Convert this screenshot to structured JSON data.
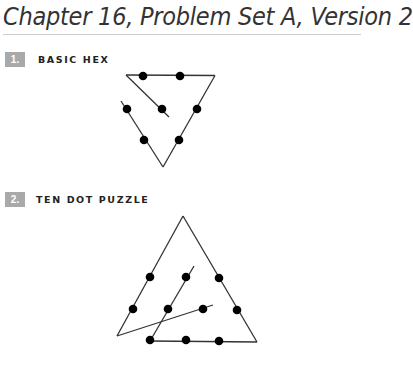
{
  "document": {
    "title": "Chapter 16, Problem Set A, Version 2"
  },
  "problems": [
    {
      "number": "1.",
      "heading": "BASIC HEX",
      "figure": "triangle-dot-puzzle",
      "dot_count": 9
    },
    {
      "number": "2.",
      "heading": "TEN DOT PUZZLE",
      "figure": "triangle-dot-puzzle",
      "dot_count": 10
    }
  ],
  "colors": {
    "badge": "#a9a9a9",
    "ink": "#000000",
    "rule": "#cfcfcf"
  }
}
